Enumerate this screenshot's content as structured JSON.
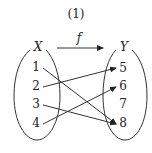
{
  "title": "(1)",
  "function_label": "f",
  "domain_set": {
    "label": "X",
    "elements": [
      "1",
      "2",
      "3",
      "4"
    ]
  },
  "codomain_set": {
    "label": "Y",
    "elements": [
      "5",
      "6",
      "7",
      "8"
    ]
  },
  "mappings": [
    {
      "from": "1",
      "to": "8"
    },
    {
      "from": "2",
      "to": "5"
    },
    {
      "from": "3",
      "to": "8"
    },
    {
      "from": "4",
      "to": "6"
    }
  ]
}
